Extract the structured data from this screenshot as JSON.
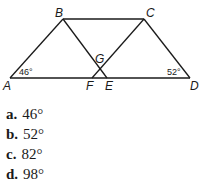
{
  "figure": {
    "points": {
      "A": "A",
      "B": "B",
      "C": "C",
      "D": "D",
      "E": "E",
      "F": "F",
      "G": "G"
    },
    "angles": {
      "A": "46°",
      "D": "52°"
    }
  },
  "choices": [
    {
      "letter": "a.",
      "value": "46°"
    },
    {
      "letter": "b.",
      "value": "52°"
    },
    {
      "letter": "c.",
      "value": "82°"
    },
    {
      "letter": "d.",
      "value": "98°"
    }
  ]
}
